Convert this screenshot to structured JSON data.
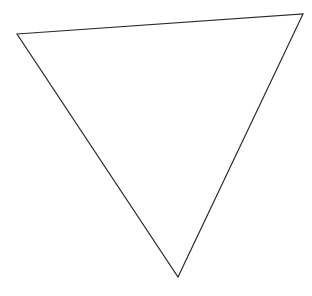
{
  "canvas": {
    "width": 312,
    "height": 296,
    "background": "#ffffff"
  },
  "shape": {
    "type": "triangle",
    "fill": "none",
    "stroke": "#2a2a2a",
    "stroke_width": 1.2,
    "points": "17,34 303,14 178,277"
  }
}
